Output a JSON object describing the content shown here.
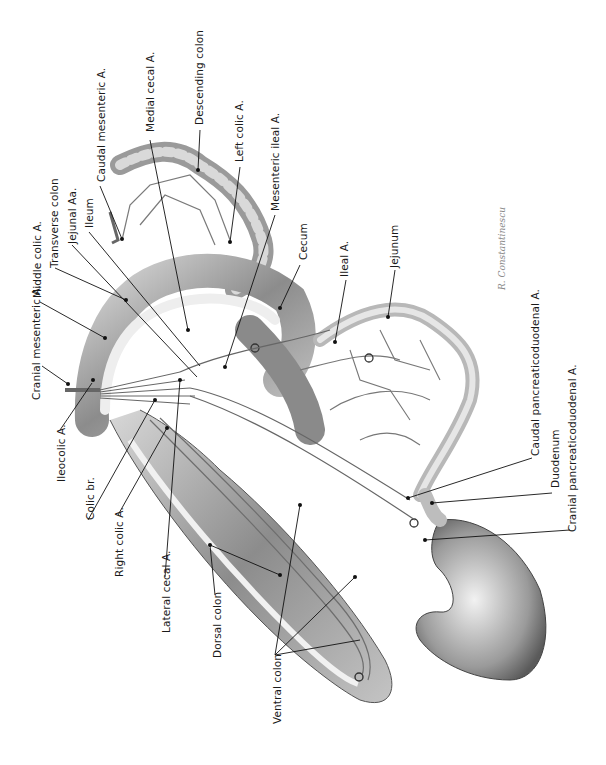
{
  "figure": {
    "orientation": "rotated 90 degrees counter-clockwise",
    "signature": "R. Constantinescu",
    "labels": [
      {
        "text": "Cranial mesenteric A.",
        "x": 58,
        "y": 400
      },
      {
        "text": "Middle colic A.",
        "x": 38,
        "y": 297
      },
      {
        "text": "Transverse colon",
        "x": 55,
        "y": 265
      },
      {
        "text": "Jejunal Aa.",
        "x": 72,
        "y": 243
      },
      {
        "text": "Ileum",
        "x": 89,
        "y": 228
      },
      {
        "text": "Caudal mesenteric A.",
        "x": 97,
        "y": 180
      },
      {
        "text": "Medial cecal A.",
        "x": 146,
        "y": 131
      },
      {
        "text": "Descending colon",
        "x": 196,
        "y": 125
      },
      {
        "text": "Left colic A.",
        "x": 236,
        "y": 162
      },
      {
        "text": "Mesenteric ileal A.",
        "x": 271,
        "y": 210
      },
      {
        "text": "Cecum",
        "x": 302,
        "y": 258
      },
      {
        "text": "Ileal A.",
        "x": 341,
        "y": 275
      },
      {
        "text": "Jejunum",
        "x": 392,
        "y": 267
      },
      {
        "text": "Caudal pancreaticoduodenal A.",
        "x": 528,
        "y": 452
      },
      {
        "text": "Duodenum",
        "x": 548,
        "y": 488
      },
      {
        "text": "Cranial pancreaticoduodenal A.",
        "x": 565,
        "y": 532
      },
      {
        "text": "Ileocolic A.",
        "x": 56,
        "y": 482
      },
      {
        "text": "Colic br.",
        "x": 84,
        "y": 520
      },
      {
        "text": "Right colic A.",
        "x": 114,
        "y": 577
      },
      {
        "text": "Lateral cecal A.",
        "x": 160,
        "y": 632
      },
      {
        "text": "Dorsal colon",
        "x": 212,
        "y": 658
      },
      {
        "text": "Ventral colon",
        "x": 272,
        "y": 724
      }
    ]
  }
}
